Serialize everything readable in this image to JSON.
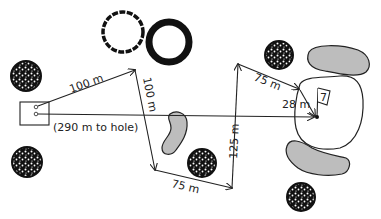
{
  "diagram": {
    "type": "golf-hole-layout",
    "hole_number": "7",
    "tee_note": "(290 m to hole)",
    "shots": [
      {
        "label": "100 m",
        "from": [
          35,
          107
        ],
        "to": [
          135,
          70
        ],
        "label_pos": [
          82,
          86
        ],
        "label_rot": -20
      },
      {
        "label": "100 m",
        "from": [
          135,
          70
        ],
        "to": [
          155,
          170
        ],
        "label_pos": [
          147,
          95
        ],
        "label_rot": 79
      },
      {
        "label": "75 m",
        "from": [
          155,
          170
        ],
        "to": [
          232,
          188
        ],
        "label_pos": [
          181,
          191
        ],
        "label_rot": 13
      },
      {
        "label": "125 m",
        "from": [
          232,
          188
        ],
        "to": [
          238,
          64
        ],
        "label_pos": [
          244,
          160
        ],
        "label_rot": -87
      },
      {
        "label": "75 m",
        "from": [
          238,
          64
        ],
        "to": [
          300,
          90
        ],
        "label_pos": [
          253,
          83
        ],
        "label_rot": 22
      },
      {
        "label": "28 m",
        "from": [
          300,
          90
        ],
        "to": [
          316,
          117
        ],
        "label_pos": [
          282,
          106
        ],
        "label_rot": 0
      }
    ],
    "direct_line": {
      "from": [
        35,
        114
      ],
      "to": [
        316,
        117
      ]
    },
    "colors": {
      "ink": "#222222",
      "bunker": "#bdbdbd",
      "background": "#ffffff",
      "tree_dark": "#111111",
      "tree_light": "#ffffff"
    }
  }
}
